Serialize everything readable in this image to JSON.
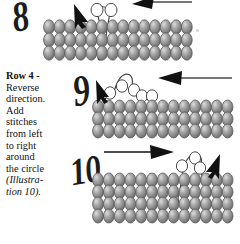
{
  "document": {
    "type": "beadwork-instruction-diagram",
    "background_color": "#ffffff",
    "ink_color": "#1a1a1a"
  },
  "instructions": {
    "heading": "Row 4 -",
    "lines": [
      "Reverse",
      "direction.",
      "Add",
      "stitches",
      "from left",
      "to right",
      "around",
      "the circle"
    ],
    "reference_lines": [
      "(Illustra-",
      "tion 10)."
    ]
  },
  "figures": [
    {
      "id": "illustration-8",
      "number": "8",
      "bead_rows": 3,
      "bead_columns": 14,
      "new_beads": 2,
      "arrow": {
        "direction": "left",
        "label": "left-arrow"
      },
      "needle": {
        "direction": "up-left",
        "label": "needle-arrow"
      }
    },
    {
      "id": "illustration-9",
      "number": "9",
      "bead_rows": 3,
      "bead_columns": 13,
      "new_beads": 5,
      "arrow": {
        "direction": "left",
        "label": "left-arrow"
      },
      "needle": {
        "direction": "up-left",
        "label": "needle-arrow"
      }
    },
    {
      "id": "illustration-10",
      "number": "10",
      "bead_rows": 4,
      "bead_columns": 13,
      "new_beads": 3,
      "arrow": {
        "direction": "right",
        "label": "right-arrow"
      },
      "needle": {
        "direction": "up-right",
        "label": "needle-arrow"
      }
    }
  ],
  "colors": {
    "bead_fill": "#9a9a9a",
    "bead_highlight": "#d9d9d9",
    "bead_shadow": "#6f6f6f",
    "bead_stroke": "#5a5a5a",
    "open_bead_fill": "#ffffff",
    "thread": "#3a3a3a",
    "arrow": "#111111"
  }
}
